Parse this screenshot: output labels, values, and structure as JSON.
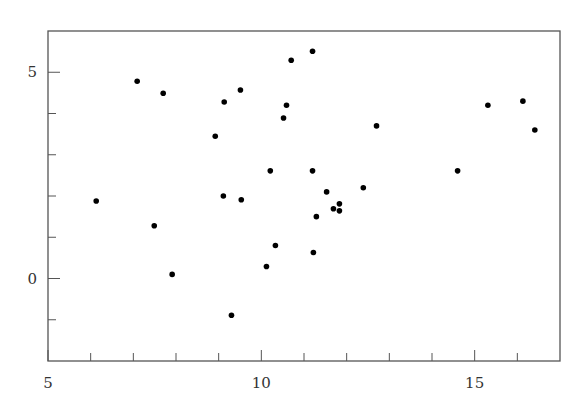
{
  "chart_data": {
    "type": "scatter",
    "title": "",
    "xlabel": "",
    "ylabel": "",
    "xlim": [
      5,
      17
    ],
    "ylim": [
      -2,
      6
    ],
    "grid": false,
    "legend": null,
    "x_major_ticks": [
      5,
      10,
      15
    ],
    "x_minor_ticks": [
      6,
      7,
      8,
      9,
      11,
      12,
      13,
      14,
      16
    ],
    "y_major_ticks": [
      0,
      5
    ],
    "y_minor_ticks": [
      -1,
      1,
      2,
      3,
      4
    ],
    "marker_color": "#000000",
    "series": [
      {
        "name": "points",
        "points": [
          [
            6.13,
            1.88
          ],
          [
            7.09,
            4.78
          ],
          [
            7.49,
            1.28
          ],
          [
            7.7,
            4.49
          ],
          [
            7.91,
            0.1
          ],
          [
            8.92,
            3.45
          ],
          [
            9.13,
            4.28
          ],
          [
            9.11,
            2.0
          ],
          [
            9.3,
            -0.89
          ],
          [
            9.51,
            4.57
          ],
          [
            9.53,
            1.91
          ],
          [
            10.12,
            0.29
          ],
          [
            10.21,
            2.61
          ],
          [
            10.33,
            0.8
          ],
          [
            10.52,
            3.89
          ],
          [
            10.59,
            4.2
          ],
          [
            10.7,
            5.29
          ],
          [
            11.2,
            5.51
          ],
          [
            11.2,
            2.61
          ],
          [
            11.22,
            0.63
          ],
          [
            11.29,
            1.5
          ],
          [
            11.53,
            2.1
          ],
          [
            11.69,
            1.69
          ],
          [
            11.83,
            1.81
          ],
          [
            11.83,
            1.64
          ],
          [
            12.39,
            2.2
          ],
          [
            12.7,
            3.7
          ],
          [
            14.6,
            2.61
          ],
          [
            15.31,
            4.2
          ],
          [
            16.13,
            4.3
          ],
          [
            16.41,
            3.6
          ]
        ]
      }
    ]
  }
}
